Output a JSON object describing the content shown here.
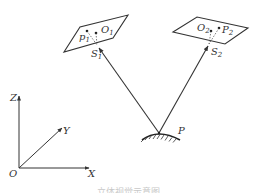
{
  "diagram": {
    "type": "stereo vision / binocular camera geometry",
    "camera1": {
      "image_plane_label": "p1",
      "optical_center_label": "O1",
      "projection_center_label": "S1"
    },
    "camera2": {
      "image_plane_label": "P2",
      "optical_center_label": "O2",
      "projection_center_label": "S2"
    },
    "object_point_label": "P",
    "axes": {
      "origin": "O",
      "x": "X",
      "y": "Y",
      "z": "Z"
    },
    "caption": "立体视觉示意图"
  },
  "labels": {
    "p1": "p",
    "p1_sub": "1",
    "o1": "O",
    "o1_sub": "1",
    "s1": "S",
    "s1_sub": "1",
    "o2": "O",
    "o2_sub": "2",
    "p2": "P",
    "p2_sub": "2",
    "s2": "S",
    "s2_sub": "2",
    "P": "P",
    "Z": "Z",
    "Y": "Y",
    "X": "X",
    "O": "O"
  },
  "colors": {
    "line": "#333333",
    "caption": "#c8c8c8"
  }
}
